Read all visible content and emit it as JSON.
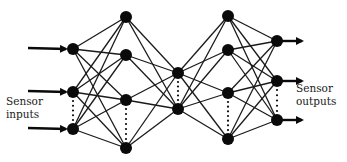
{
  "diagram": {
    "type": "feedforward-neural-network",
    "colors": {
      "node": "#0a0a0a",
      "edge": "#1a1a1a",
      "background": "#ffffff",
      "text": "#1a1a1a"
    },
    "layers": [
      {
        "name": "input",
        "node_count_shown": 3,
        "ellipsis_between": [
          1,
          2
        ],
        "incoming_arrows": true
      },
      {
        "name": "hidden-1",
        "node_count_shown": 4,
        "ellipsis_between": [
          2,
          3
        ]
      },
      {
        "name": "bottleneck",
        "node_count_shown": 2,
        "ellipsis_between": [
          0,
          1
        ]
      },
      {
        "name": "hidden-2",
        "node_count_shown": 4,
        "ellipsis_between": [
          2,
          3
        ]
      },
      {
        "name": "output",
        "node_count_shown": 3,
        "ellipsis_between": [
          1,
          2
        ],
        "outgoing_arrows": true
      }
    ],
    "connectivity": "fully-connected",
    "labels": {
      "input_line1": "Sensor",
      "input_line2": "inputs",
      "output_line1": "Sensor",
      "output_line2": "outputs"
    }
  }
}
